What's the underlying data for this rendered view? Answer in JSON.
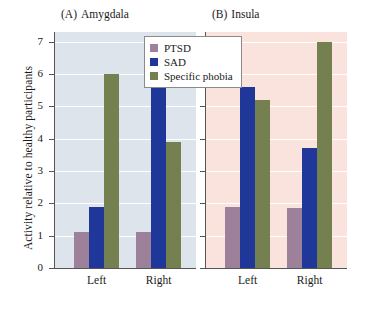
{
  "chart_data": {
    "type": "bar",
    "title": "",
    "xlabel": "",
    "ylabel": "Activity relative to healthy participants",
    "ylim": [
      0,
      7.3
    ],
    "yticks": [
      0,
      1,
      2,
      3,
      4,
      5,
      6,
      7
    ],
    "ytick_labels": [
      "0",
      "1",
      "2",
      "3",
      "4",
      "5",
      "6",
      "7"
    ],
    "grid": true,
    "legend_position": "top-center",
    "categories": [
      "Left",
      "Right"
    ],
    "panels": [
      {
        "key": "A",
        "paren_label": "(A)",
        "title": "Amygdala",
        "full_title": "(A)  Amygdala",
        "background_color": "#dde4ec",
        "categories": [
          "Left",
          "Right"
        ],
        "series": [
          {
            "name": "PTSD",
            "color": "#9d8099",
            "values": [
              1.1,
              1.1
            ]
          },
          {
            "name": "SAD",
            "color": "#20379a",
            "values": [
              1.9,
              5.65
            ]
          },
          {
            "name": "Specific phobia",
            "color": "#74804f",
            "values": [
              6.0,
              3.9
            ]
          }
        ]
      },
      {
        "key": "B",
        "paren_label": "(B)",
        "title": "Insula",
        "full_title": "(B)  Insula",
        "background_color": "#fbe3dd",
        "categories": [
          "Left",
          "Right"
        ],
        "series": [
          {
            "name": "PTSD",
            "color": "#9d8099",
            "values": [
              1.9,
              1.85
            ]
          },
          {
            "name": "SAD",
            "color": "#20379a",
            "values": [
              5.6,
              3.72
            ]
          },
          {
            "name": "Specific phobia",
            "color": "#74804f",
            "values": [
              5.2,
              7.0
            ]
          }
        ]
      }
    ],
    "legend": [
      {
        "name": "PTSD",
        "color": "#9d8099"
      },
      {
        "name": "SAD",
        "color": "#20379a"
      },
      {
        "name": "Specific phobia",
        "color": "#74804f"
      }
    ]
  }
}
